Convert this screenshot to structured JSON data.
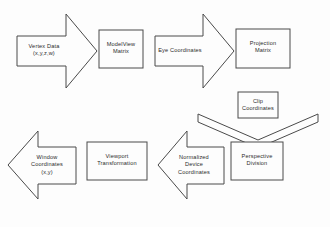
{
  "diagram": {
    "background_color": "#fdfdfd",
    "stroke_color": "#4a4a4a",
    "text_color": "#2b2b2b",
    "nodes": [
      {
        "id": "vertex-data",
        "shape": "arrow-right",
        "label": "Vertex Data\n(x,y,z,w)",
        "row": "top"
      },
      {
        "id": "modelview-matrix",
        "shape": "rectangle",
        "label": "ModelView\nMatrix",
        "row": "top"
      },
      {
        "id": "eye-coordinates",
        "shape": "arrow-right",
        "label": "Eye Coordinates",
        "row": "top"
      },
      {
        "id": "projection-matrix",
        "shape": "rectangle",
        "label": "Projection\nMatrix",
        "row": "top"
      },
      {
        "id": "clip-coordinates",
        "shape": "rectangle",
        "label": "Clip\nCoordinates",
        "row": "middle"
      },
      {
        "id": "clip-down-arrow",
        "shape": "arrow-down",
        "label": "",
        "row": "middle"
      },
      {
        "id": "perspective-division",
        "shape": "rectangle",
        "label": "Perspective\nDivision",
        "row": "bottom"
      },
      {
        "id": "normalized-device-coordinates",
        "shape": "arrow-left",
        "label": "Normalized\nDevice\nCoordinates",
        "row": "bottom"
      },
      {
        "id": "viewport-transformation",
        "shape": "rectangle",
        "label": "Viewport\nTransformation",
        "row": "bottom"
      },
      {
        "id": "window-coordinates",
        "shape": "arrow-left",
        "label": "Window\nCoordinates\n(x,y)",
        "row": "bottom"
      }
    ]
  }
}
